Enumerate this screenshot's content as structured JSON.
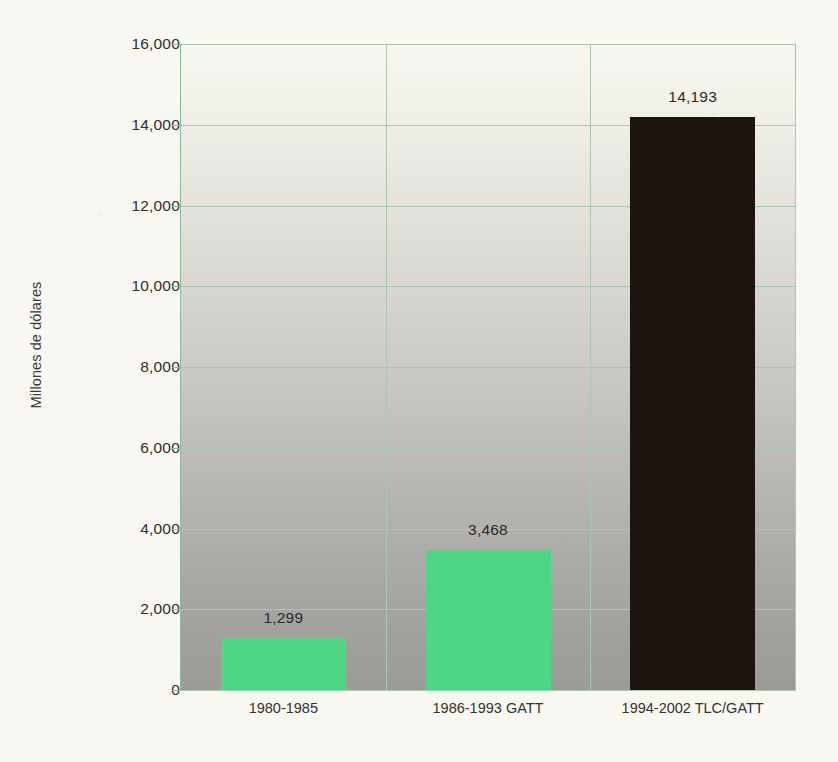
{
  "chart_data": {
    "type": "bar",
    "title": "",
    "xlabel": "",
    "ylabel": "Millones de dólares",
    "categories": [
      "1980-1985",
      "1986-1993 GATT",
      "1994-2002 TLC/GATT"
    ],
    "values": [
      1299,
      3468,
      14193
    ],
    "value_labels": [
      "1,299",
      "3,468",
      "14,193"
    ],
    "ylim": [
      0,
      16000
    ],
    "ytick_values": [
      0,
      2000,
      4000,
      6000,
      8000,
      10000,
      12000,
      14000,
      16000
    ],
    "ytick_labels": [
      "0",
      "2,000",
      "4,000",
      "6,000",
      "8,000",
      "10,000",
      "12,000",
      "14,000",
      "16,000"
    ],
    "grid": true,
    "legend": "none",
    "bar_colors": [
      "#4ed585",
      "#4ed585",
      "#1d1410"
    ],
    "colors": {
      "page_background": "#f8f7f1",
      "gridline": "#a9c9af",
      "axis": "#8fb897",
      "plot_gradient_top": "#f7f6f0",
      "plot_gradient_bottom": "#9b9b98",
      "bar_green": "#4ed585",
      "bar_black": "#1d1410",
      "tick_text": "#2f2f2d"
    }
  }
}
